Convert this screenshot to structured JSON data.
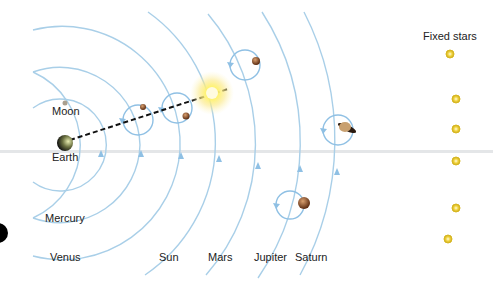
{
  "diagram": {
    "colors": {
      "orbit": "#a9cfe8",
      "epicycle": "#7fb6e0",
      "star": "#f0d23a",
      "sun": "#fff27a"
    },
    "labels": {
      "moon": "Moon",
      "earth": "Earth",
      "mercury": "Mercury",
      "venus": "Venus",
      "sun": "Sun",
      "mars": "Mars",
      "jupiter": "Jupiter",
      "saturn": "Saturn",
      "fixed_stars": "Fixed stars"
    }
  }
}
